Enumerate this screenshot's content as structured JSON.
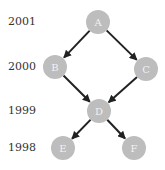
{
  "years": [
    {
      "label": "2001",
      "y": 22
    },
    {
      "label": "2000",
      "y": 67
    },
    {
      "label": "1999",
      "y": 111
    },
    {
      "label": "1998",
      "y": 148
    }
  ],
  "nodes": [
    {
      "id": "A",
      "label": "A",
      "x": 98,
      "y": 22
    },
    {
      "id": "B",
      "label": "B",
      "x": 55,
      "y": 67
    },
    {
      "id": "C",
      "label": "C",
      "x": 146,
      "y": 69
    },
    {
      "id": "D",
      "label": "D",
      "x": 99,
      "y": 111
    },
    {
      "id": "E",
      "label": "E",
      "x": 63,
      "y": 148
    },
    {
      "id": "F",
      "label": "F",
      "x": 134,
      "y": 148
    }
  ],
  "edges": [
    {
      "from": "A",
      "to": "B"
    },
    {
      "from": "A",
      "to": "C"
    },
    {
      "from": "B",
      "to": "D"
    },
    {
      "from": "C",
      "to": "D"
    },
    {
      "from": "D",
      "to": "E"
    },
    {
      "from": "D",
      "to": "F"
    }
  ],
  "colors": {
    "node_fill": "#bdbdbd",
    "edge": "#222222",
    "node_text": "#f2f2f2"
  }
}
